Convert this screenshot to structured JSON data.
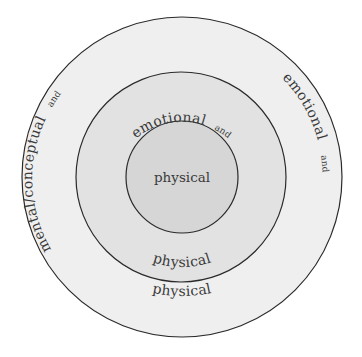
{
  "diagram": {
    "type": "concentric-circles",
    "colors": {
      "background": "#ffffff",
      "outer_fill": "#efefef",
      "middle_fill": "#e2e2e2",
      "inner_fill": "#d6d6d6",
      "stroke": "#2a2a2a",
      "text": "#3a3a3a"
    },
    "inner": {
      "label": "physical"
    },
    "middle": {
      "top_label": "emotional",
      "top_connector": "and",
      "bottom_label": "physical"
    },
    "outer": {
      "left_label": "mental/conceptual",
      "left_connector": "and",
      "right_label": "emotional",
      "right_connector": "and",
      "bottom_label": "physical"
    }
  }
}
